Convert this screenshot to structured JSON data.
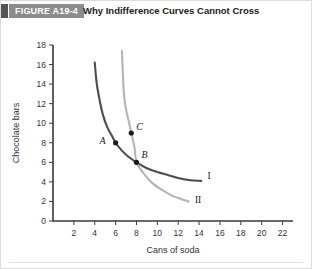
{
  "figure": {
    "badge_label": "FIGURE A19-4",
    "title": "Why Indifference Curves Cannot Cross",
    "badge_color": "#8c8c8c",
    "badge_tab_color": "#555555"
  },
  "chart_data": {
    "type": "line",
    "title": "Why Indifference Curves Cannot Cross",
    "xlabel": "Cans of soda",
    "ylabel": "Chocolate bars",
    "xlim": [
      0,
      23
    ],
    "ylim": [
      0,
      18
    ],
    "xticks": [
      2,
      4,
      6,
      8,
      10,
      12,
      14,
      16,
      18,
      20,
      22
    ],
    "yticks": [
      0,
      2,
      4,
      6,
      8,
      10,
      12,
      14,
      16,
      18
    ],
    "grid": false,
    "legend_position": "inline-curve-end",
    "series": [
      {
        "name": "I",
        "color": "#4d4d4d",
        "label": "I",
        "label_point": [
          14.8,
          4.6
        ],
        "points": [
          [
            4.0,
            16.2
          ],
          [
            4.2,
            14.0
          ],
          [
            4.5,
            12.2
          ],
          [
            4.8,
            10.8
          ],
          [
            5.2,
            9.6
          ],
          [
            5.7,
            8.6
          ],
          [
            6.0,
            8.0
          ],
          [
            6.6,
            7.2
          ],
          [
            7.2,
            6.6
          ],
          [
            8.0,
            6.0
          ],
          [
            9.0,
            5.4
          ],
          [
            10.0,
            5.0
          ],
          [
            11.0,
            4.7
          ],
          [
            12.0,
            4.4
          ],
          [
            13.0,
            4.2
          ],
          [
            14.2,
            4.1
          ]
        ]
      },
      {
        "name": "II",
        "color": "#b5b5b5",
        "label": "II",
        "label_point": [
          13.6,
          2.1
        ],
        "points": [
          [
            6.6,
            17.4
          ],
          [
            6.7,
            15.0
          ],
          [
            6.8,
            13.0
          ],
          [
            7.0,
            11.4
          ],
          [
            7.3,
            10.0
          ],
          [
            7.5,
            9.0
          ],
          [
            7.8,
            7.6
          ],
          [
            8.0,
            6.0
          ],
          [
            8.6,
            5.0
          ],
          [
            9.4,
            4.0
          ],
          [
            10.4,
            3.2
          ],
          [
            11.4,
            2.6
          ],
          [
            12.4,
            2.2
          ],
          [
            13.0,
            2.0
          ]
        ]
      }
    ],
    "annotations": [
      {
        "label": "A",
        "x": 6.0,
        "y": 8.0,
        "label_dx": -10,
        "label_dy": 1,
        "on_curve": "I"
      },
      {
        "label": "B",
        "x": 8.0,
        "y": 6.0,
        "label_dx": 5,
        "label_dy": -4,
        "on_curve": "I,II"
      },
      {
        "label": "C",
        "x": 7.5,
        "y": 9.0,
        "label_dx": 5,
        "label_dy": -3,
        "on_curve": "II"
      }
    ]
  }
}
